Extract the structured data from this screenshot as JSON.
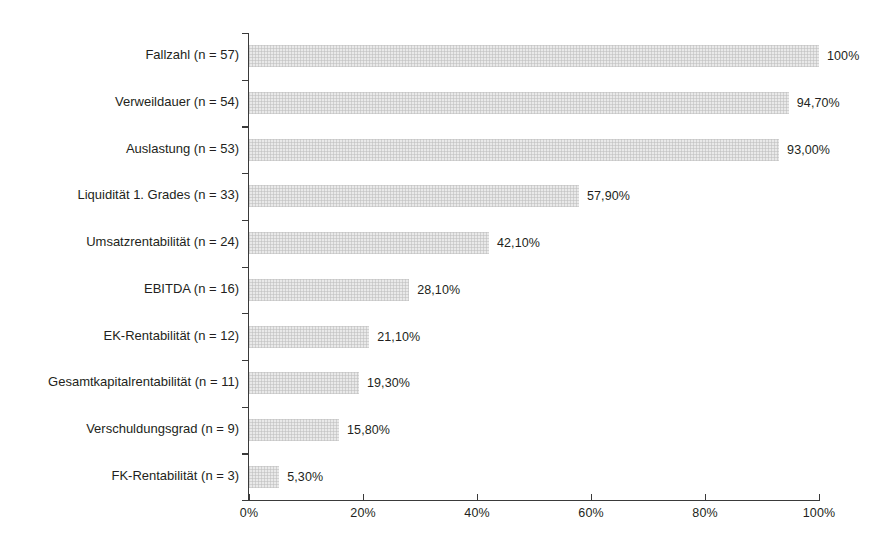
{
  "chart_data": {
    "type": "bar",
    "orientation": "horizontal",
    "title": "",
    "subtitle": "",
    "xlabel": "",
    "ylabel": "",
    "xlim": [
      0,
      100
    ],
    "grid": false,
    "legend": null,
    "bar_color": "#e9e9e9",
    "text_color": "#231f20",
    "axis_color": "#3a3a3a",
    "categories": [
      "Fallzahl (n = 57)",
      "Verweildauer (n = 54)",
      "Auslastung (n = 53)",
      "Liquidität 1. Grades (n = 33)",
      "Umsatzrentabilität (n = 24)",
      "EBITDA (n = 16)",
      "EK-Rentabilität (n = 12)",
      "Gesamtkapitalrentabilität (n = 11)",
      "Verschuldungsgrad (n =  9)",
      "FK-Rentabilität (n = 3)"
    ],
    "values": [
      100,
      94.7,
      93.0,
      57.9,
      42.1,
      28.1,
      21.1,
      19.3,
      15.8,
      5.3
    ],
    "value_labels": [
      "100%",
      "94,70%",
      "93,00%",
      "57,90%",
      "42,10%",
      "28,10%",
      "21,10%",
      "19,30%",
      "15,80%",
      "5,30%"
    ],
    "counts": [
      57,
      54,
      53,
      33,
      24,
      16,
      12,
      11,
      9,
      3
    ],
    "xticks": [
      0,
      20,
      40,
      60,
      80,
      100
    ],
    "xtick_labels": [
      "0%",
      "20%",
      "40%",
      "60%",
      "80%",
      "100%"
    ]
  }
}
